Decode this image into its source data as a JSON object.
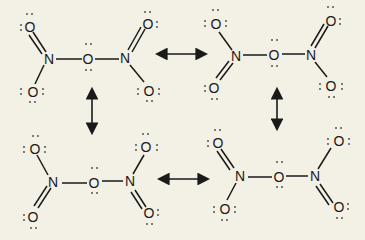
{
  "diagram": {
    "background": "#f3f0e6",
    "structures": [
      {
        "id": "top-left",
        "atoms": {
          "o1": "O",
          "n1": "N",
          "o_bridge": "O",
          "n2": "N",
          "o3": "O",
          "o4": "O",
          "o2": "O"
        }
      },
      {
        "id": "top-right",
        "atoms": {
          "o1": "O",
          "n1": "N",
          "o_bridge": "O",
          "n2": "N",
          "o3": "O",
          "o4": "O",
          "o2": "O"
        }
      },
      {
        "id": "bottom-left",
        "atoms": {
          "o1": "O",
          "n1": "N",
          "o_bridge": "O",
          "n2": "N",
          "o3": "O",
          "o4": "O",
          "o2": "O"
        }
      },
      {
        "id": "bottom-right",
        "atoms": {
          "o1": "O",
          "n1": "N",
          "o_bridge": "O",
          "n2": "N",
          "o3": "O",
          "o4": "O",
          "o2": "O"
        }
      }
    ],
    "arrows": [
      {
        "from": "top-left",
        "to": "top-right",
        "type": "double-headed"
      },
      {
        "from": "top-left",
        "to": "bottom-left",
        "type": "double-headed"
      },
      {
        "from": "top-right",
        "to": "bottom-right",
        "type": "double-headed"
      },
      {
        "from": "bottom-left",
        "to": "bottom-right",
        "type": "double-headed"
      }
    ]
  }
}
